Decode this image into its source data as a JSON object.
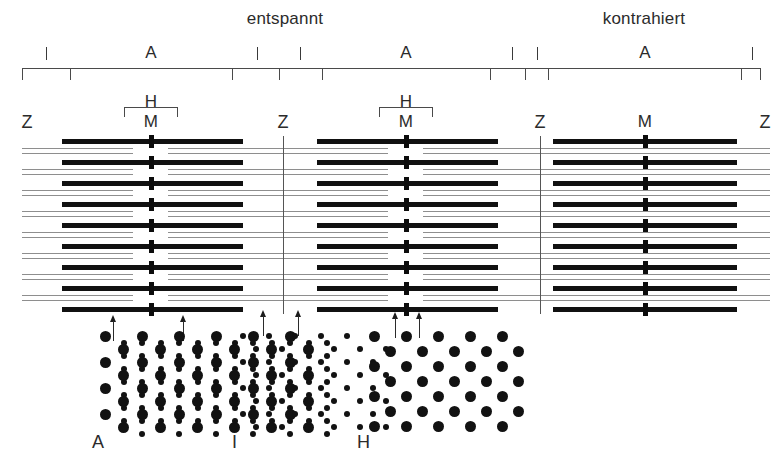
{
  "figure": {
    "title_left": "entspannt",
    "title_right": "kontrahiert"
  },
  "states": [
    {
      "id": "relaxed",
      "label": "entspannt",
      "x": 285
    },
    {
      "id": "contracted",
      "label": "kontrahiert",
      "x": 644
    }
  ],
  "band_scale": {
    "rule_y": 68,
    "marks": [
      {
        "label": "I",
        "x": 46,
        "band": "I"
      },
      {
        "label": "A",
        "x": 151,
        "band": "A"
      },
      {
        "label": "I",
        "x": 257,
        "band": "I"
      },
      {
        "label": "I",
        "x": 300,
        "band": "I"
      },
      {
        "label": "A",
        "x": 406,
        "band": "A"
      },
      {
        "label": "I",
        "x": 512,
        "band": "I"
      },
      {
        "label": "I",
        "x": 537,
        "band": "I"
      },
      {
        "label": "A",
        "x": 645,
        "band": "A"
      },
      {
        "label": "I",
        "x": 752,
        "band": "I"
      }
    ],
    "tick_positions": [
      22,
      70,
      232,
      279,
      322,
      490,
      525,
      548,
      741,
      760
    ]
  },
  "zone_labels": [
    {
      "label": "H",
      "x": 151,
      "y": 93,
      "for": "h-zone-left"
    },
    {
      "label": "M",
      "x": 151,
      "y": 113,
      "for": "m-line-left"
    },
    {
      "label": "H",
      "x": 406,
      "y": 93,
      "for": "h-zone-middle"
    },
    {
      "label": "M",
      "x": 406,
      "y": 113,
      "for": "m-line-middle"
    },
    {
      "label": "M",
      "x": 645,
      "y": 113,
      "for": "m-line-right"
    }
  ],
  "z_labels": [
    {
      "label": "Z",
      "x": 27,
      "y": 113
    },
    {
      "label": "Z",
      "x": 283,
      "y": 113
    },
    {
      "label": "Z",
      "x": 540,
      "y": 113
    },
    {
      "label": "Z",
      "x": 765,
      "y": 113
    }
  ],
  "z_lines": [
    {
      "x": 283,
      "y": 136,
      "height": 178
    },
    {
      "x": 540,
      "y": 136,
      "height": 178
    }
  ],
  "sarcomeres": [
    {
      "id": "relaxed-left",
      "state": "entspannt",
      "myosin_left": 62,
      "myosin_right": 243,
      "m_line_x": 151,
      "actin_left_start": 22,
      "actin_left_end": 133,
      "actin_right_start": 168,
      "actin_right_end": 283
    },
    {
      "id": "relaxed-right",
      "state": "entspannt",
      "myosin_left": 317,
      "myosin_right": 498,
      "m_line_x": 406,
      "actin_left_start": 283,
      "actin_left_end": 388,
      "actin_right_start": 423,
      "actin_right_end": 540
    },
    {
      "id": "contracted",
      "state": "kontrahiert",
      "myosin_left": 553,
      "myosin_right": 737,
      "m_line_x": 645,
      "actin_left_start": 510,
      "actin_left_end": 690,
      "actin_right_start": 600,
      "actin_right_end": 770
    }
  ],
  "lattice": {
    "row_count": 9,
    "first_myosin_y": 139,
    "row_pitch": 21,
    "actin_pair_gap": 5
  },
  "section_arrows": [
    {
      "id": "arrow-a-band-left",
      "x": 113,
      "y": 315,
      "points_to": "A-Bande"
    },
    {
      "id": "arrow-a-band-right",
      "x": 183,
      "y": 315,
      "points_to": "A-Bande"
    },
    {
      "id": "arrow-i-band-left",
      "x": 263,
      "y": 310,
      "points_to": "I-Bande"
    },
    {
      "id": "arrow-i-band-right",
      "x": 298,
      "y": 310,
      "points_to": "I-Bande"
    },
    {
      "id": "arrow-h-zone-left",
      "x": 395,
      "y": 312,
      "points_to": "H-Zone"
    },
    {
      "id": "arrow-h-zone-right",
      "x": 419,
      "y": 312,
      "points_to": "H-Zone"
    }
  ],
  "cross_sections": [
    {
      "id": "xsec-a-band",
      "label": "A",
      "label_x": 92,
      "label_y": 433,
      "x": 105,
      "y": 336,
      "cols": 6,
      "rows": 8,
      "col_pitch": 37,
      "row_pitch": 13,
      "thick_radius": 5.5,
      "thin_radius": 3.0,
      "has_thick": true,
      "has_thin": true,
      "caption": "A-Bande: dicke Myosin- und dünne Aktinfilamente im hexagonalen Gitter"
    },
    {
      "id": "xsec-i-band",
      "label": "I",
      "label_x": 232,
      "label_y": 433,
      "x": 243,
      "y": 336,
      "cols": 6,
      "rows": 8,
      "col_pitch": 26,
      "row_pitch": 13,
      "thick_radius": 0,
      "thin_radius": 3.0,
      "has_thick": false,
      "has_thin": true,
      "caption": "I-Bande: nur dünne Aktinfilamente"
    },
    {
      "id": "xsec-h-zone",
      "label": "H",
      "label_x": 357,
      "label_y": 433,
      "x": 374,
      "y": 336,
      "cols": 5,
      "rows": 7,
      "col_pitch": 32,
      "row_pitch": 15,
      "thick_radius": 5.5,
      "thin_radius": 0,
      "has_thick": true,
      "has_thin": false,
      "caption": "H-Zone: nur dicke Myosinfilamente"
    }
  ],
  "colors": {
    "myosin": "#111111",
    "actin": "#8e8e8e",
    "m_line": "#0c0c0c",
    "z_line": "#555555",
    "rule": "#4a4a4a",
    "text": "#2b2b2b",
    "background": "#ffffff"
  }
}
